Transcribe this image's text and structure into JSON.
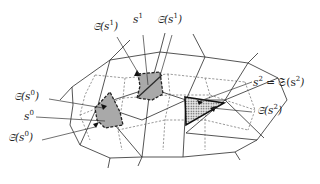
{
  "figure": {
    "type": "mesh-with-dual-cells"
  },
  "labels": {
    "s1_dot": {
      "base": "𝔖̇(s",
      "sup": "1",
      "close": ")"
    },
    "s1": {
      "base": "s",
      "sup": "1"
    },
    "s1_frak": {
      "base": "𝔖(s",
      "sup": "1",
      "close": ")"
    },
    "s0_frak": {
      "base": "𝔖(s",
      "sup": "0",
      "close": ")"
    },
    "s0": {
      "base": "s",
      "sup": "0"
    },
    "s0_dot": {
      "base": "𝔖̇(s",
      "sup": "0",
      "close": ")"
    },
    "s2_eq": {
      "base": "s",
      "sup": "2",
      "mid": " = 𝔖(s",
      "sup2": "2",
      "close": ")"
    },
    "s2_dot": {
      "base": "𝔖̇(s",
      "sup": "2",
      "close": ")"
    }
  },
  "colors": {
    "line": "#2a2a2a",
    "cell_fill_gray": "#a9a9a9",
    "background": "#ffffff"
  }
}
